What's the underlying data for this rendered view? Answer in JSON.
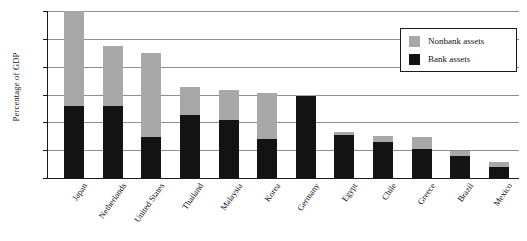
{
  "chart_data": {
    "type": "bar",
    "subtype": "stacked-vertical",
    "title": "",
    "xlabel": "",
    "ylabel": "Percentage of GDP",
    "ylim": [
      0,
      300
    ],
    "ytick_values": [
      0,
      50,
      100,
      150,
      200,
      250,
      300
    ],
    "ytick_labels": [
      "0",
      "50",
      "100",
      "150",
      "200",
      "250",
      "300"
    ],
    "grid": true,
    "grid_axis": "y",
    "legend_position": "upper-right",
    "categories": [
      "Japan",
      "Netherlands",
      "United States",
      "Thailand",
      "Malaysia",
      "Korea",
      "Germany",
      "Egypt",
      "Chile",
      "Greece",
      "Brazil",
      "Mexico"
    ],
    "series": [
      {
        "name": "Bank assets",
        "color": "#131313",
        "values": [
          130,
          130,
          73,
          113,
          105,
          70,
          147,
          78,
          65,
          52,
          40,
          20
        ]
      },
      {
        "name": "Nonbank assets",
        "color": "#a8a8a8",
        "values": [
          175,
          107,
          152,
          50,
          53,
          82,
          3,
          4,
          10,
          21,
          8,
          8
        ]
      }
    ],
    "totals": [
      305,
      237,
      225,
      163,
      158,
      152,
      150,
      82,
      75,
      73,
      48,
      28
    ]
  },
  "legend": {
    "entries": [
      {
        "label": "Nonbank assets",
        "color": "#a8a8a8"
      },
      {
        "label": "Bank assets",
        "color": "#131313"
      }
    ]
  }
}
